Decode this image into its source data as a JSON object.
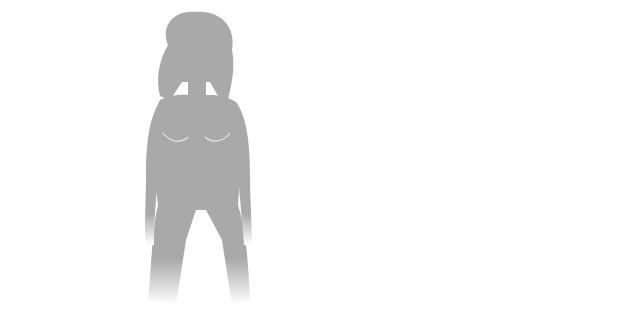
{
  "diagram": {
    "colors": {
      "silhouette": "#a9a9a9",
      "arrow": "#8a8a8a",
      "leader": "#333333",
      "text": "#222222",
      "organ_outline": "#e6e6e6",
      "adrenal": "#1a1a1a"
    },
    "center": {
      "pituitary": {
        "line1": "Pituitary gland",
        "line2": "releases hormones",
        "line3": "that stimulate"
      },
      "adrenal_left": {
        "line1": "Adrenal",
        "line2": "glands"
      },
      "adrenal_right": {
        "line1": "Adrenal",
        "line2": "glands"
      },
      "ovaries": "Ovaries",
      "testes": "Testes",
      "release": {
        "line1": "To release hormones",
        "line2": "that stimulate"
      }
    },
    "female": {
      "figure_label": "Female silhouette",
      "labels": [
        {
          "line1": "Underarm",
          "line2": "hair growth"
        },
        {
          "line1": "Breast",
          "line2": "development"
        },
        {
          "line1": "Enlargement",
          "line2": "of uterus"
        },
        {
          "line1": "Beginning of",
          "line2": "menstruation"
        },
        {
          "line1": "Pubic hair",
          "line2": "growth"
        }
      ]
    },
    "male": {
      "figure_label": "Male silhouette",
      "labels": [
        {
          "line1": "Facial hair",
          "line2": "growth"
        },
        {
          "line1": "Larynx",
          "line2": "enlargement"
        },
        {
          "line1": "Underarm",
          "line2": "hair growth"
        },
        {
          "line1": "Growth of",
          "line2": "penis and",
          "line3": "testes"
        },
        {
          "line1": "Beginning",
          "line2": "of ejaculation"
        },
        {
          "line1": "Pubic hair",
          "line2": "growth"
        }
      ]
    }
  }
}
